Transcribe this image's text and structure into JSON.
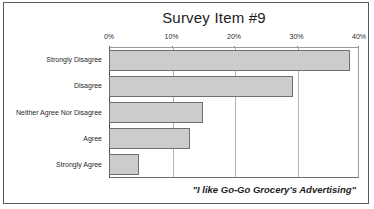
{
  "chart_data": {
    "type": "bar",
    "orientation": "horizontal",
    "title": "Survey Item #9",
    "xlabel": "",
    "ylabel": "",
    "xlim": [
      0,
      40
    ],
    "grid": true,
    "legend": false,
    "annotation": "\"I like Go-Go Grocery's Advertising\"",
    "tick_labels": [
      "0%",
      "10%",
      "20%",
      "30%",
      "40%"
    ],
    "tick_values": [
      0,
      10,
      20,
      30,
      40
    ],
    "categories": [
      "Strongly Disagree",
      "Disagree",
      "Neither Agree Nor Disagree",
      "Agree",
      "Strongly Agree"
    ],
    "values": [
      38.5,
      29.5,
      15.0,
      13.0,
      4.8
    ],
    "bar_color": "#cccccc",
    "bar_border_color": "#707070"
  },
  "frame": {
    "border_color": "#5a5a5a",
    "background": "#ffffff"
  }
}
